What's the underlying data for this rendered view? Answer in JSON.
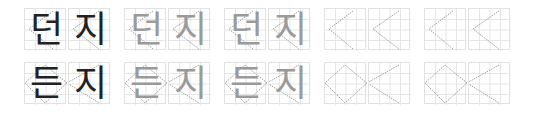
{
  "worksheet": {
    "rows": [
      {
        "word": "던지",
        "chars": [
          "던",
          "지"
        ]
      },
      {
        "word": "든지",
        "chars": [
          "든",
          "지"
        ]
      }
    ],
    "columns": [
      {
        "style": "solid"
      },
      {
        "style": "trace"
      },
      {
        "style": "trace"
      },
      {
        "style": "blank"
      },
      {
        "style": "blank"
      }
    ],
    "colors": {
      "ink": "#222222",
      "trace": "#9a9a9a",
      "grid": "#e2e2e2",
      "guide": "#888888"
    }
  },
  "r0": {
    "c0a": "던",
    "c0b": "지",
    "c1a": "던",
    "c1b": "지",
    "c2a": "던",
    "c2b": "지"
  },
  "r1": {
    "c0a": "든",
    "c0b": "지",
    "c1a": "든",
    "c1b": "지",
    "c2a": "든",
    "c2b": "지"
  }
}
